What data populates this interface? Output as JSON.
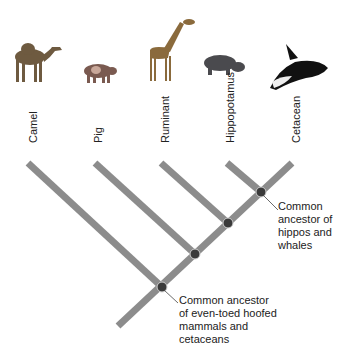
{
  "diagram": {
    "type": "cladogram",
    "colors": {
      "branch": "#8c8c8c",
      "node": "#3a3a3a",
      "text": "#222222"
    },
    "taxa": [
      {
        "id": "camel",
        "label": "Camel",
        "animal_icon": "camel-icon"
      },
      {
        "id": "pig",
        "label": "Pig",
        "animal_icon": "pig-icon"
      },
      {
        "id": "ruminant",
        "label": "Ruminant",
        "animal_icon": "giraffe-icon"
      },
      {
        "id": "hippo",
        "label": "Hippopotamus",
        "animal_icon": "hippo-icon"
      },
      {
        "id": "cetacean",
        "label": "Cetacean",
        "animal_icon": "orca-icon"
      }
    ],
    "callouts": {
      "hippo_whale": "Common ancestor of hippos and whales",
      "hippo_whale_lines": [
        "Common",
        "ancestor of",
        "hippos and",
        "whales"
      ],
      "root": "Common ancestor of even-toed hoofed mammals and cetaceans",
      "root_lines": [
        "Common ancestor",
        "of even-toed hoofed",
        "mammals and",
        "cetaceans"
      ]
    }
  }
}
